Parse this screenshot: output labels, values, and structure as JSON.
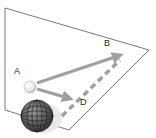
{
  "diagram": {
    "labels": {
      "a": "A",
      "b": "B",
      "d": "D"
    },
    "colors": {
      "plane_edge": "#555555",
      "arrow": "#a0a0a0",
      "dashed": "#a0a0a0",
      "globe_dark": "#3a3a3a",
      "sphere_light": "#f2f2f2"
    }
  }
}
